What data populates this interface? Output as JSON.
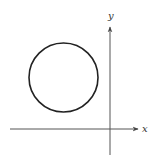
{
  "diagram": {
    "title": "",
    "axes": {
      "x_label": "x",
      "y_label": "y",
      "origin_px": [
        110,
        129
      ],
      "x_axis": {
        "from": [
          10,
          129
        ],
        "to": [
          138,
          129
        ]
      },
      "y_axis": {
        "from": [
          110,
          155
        ],
        "to": [
          110,
          26
        ]
      }
    },
    "circle": {
      "center_px": [
        63.5,
        77.5
      ],
      "radius_px": 34.5,
      "position": "second quadrant (upper-left of origin)"
    },
    "colors": {
      "stroke": "#222222",
      "axis": "#555555",
      "background": "#ffffff"
    }
  }
}
